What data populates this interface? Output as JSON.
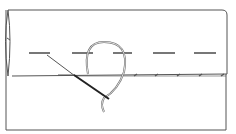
{
  "illustration": {
    "subject": "sewing-hem-stitch-diagram",
    "stroke_color": "#555555",
    "needle_color": "#222222",
    "background": "#ffffff"
  }
}
